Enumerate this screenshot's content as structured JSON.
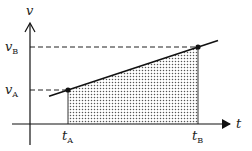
{
  "diagram": {
    "type": "velocity-time graph",
    "axes": {
      "y_label": "v",
      "x_label": "t"
    },
    "ticks": {
      "v_A": {
        "base": "v",
        "sub": "A"
      },
      "v_B": {
        "base": "v",
        "sub": "B"
      },
      "t_A": {
        "base": "t",
        "sub": "A"
      },
      "t_B": {
        "base": "t",
        "sub": "B"
      }
    },
    "points": [
      {
        "name": "A",
        "t": "t_A",
        "v": "v_A"
      },
      {
        "name": "B",
        "t": "t_B",
        "v": "v_B"
      }
    ],
    "shaded_region": "area under the line between t_A and t_B (displacement)",
    "colors": {
      "line": "#111111",
      "shade_dots": "#555555",
      "dashes": "#222222"
    }
  }
}
